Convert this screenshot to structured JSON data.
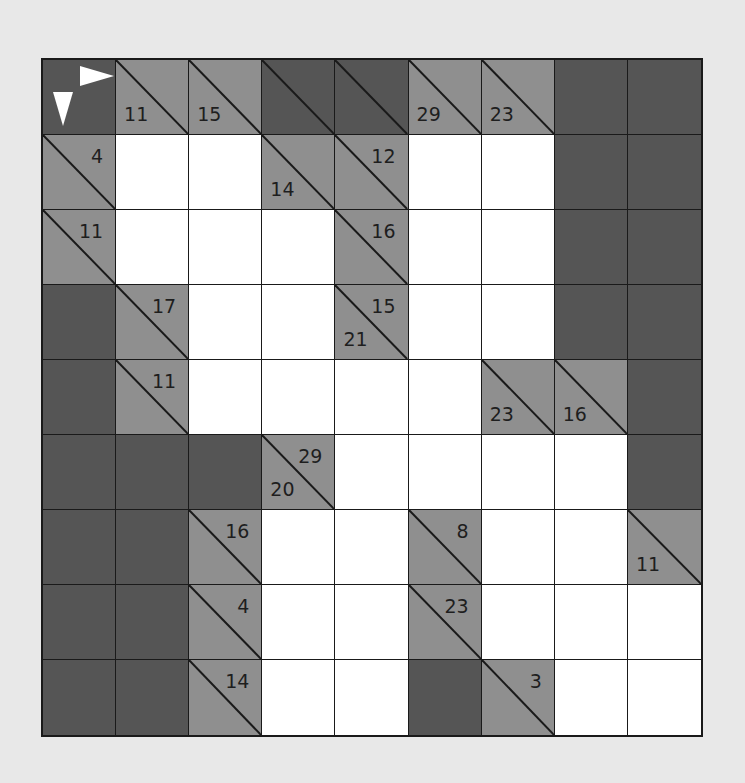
{
  "puzzle": {
    "type": "kakuro",
    "rows": 9,
    "cols": 9,
    "colors": {
      "background": "#e8e8e8",
      "dark_block": "#555555",
      "clue_cell": "#8f8f8f",
      "white_cell": "#ffffff",
      "grid_line": "#1a1a1a",
      "arrow": "#ffffff"
    },
    "start_cell": {
      "row": 0,
      "col": 0,
      "icons": [
        "arrow-right-icon",
        "arrow-down-icon"
      ]
    },
    "grid": [
      [
        {
          "t": "start"
        },
        {
          "t": "clue",
          "down": "11"
        },
        {
          "t": "clue",
          "down": "15"
        },
        {
          "t": "darkdiag"
        },
        {
          "t": "darkdiag"
        },
        {
          "t": "clue",
          "down": "29"
        },
        {
          "t": "clue",
          "down": "23"
        },
        {
          "t": "dark"
        },
        {
          "t": "dark"
        }
      ],
      [
        {
          "t": "clue",
          "across": "4"
        },
        {
          "t": "white",
          "value": ""
        },
        {
          "t": "white",
          "value": ""
        },
        {
          "t": "clue",
          "down": "14"
        },
        {
          "t": "clue",
          "across": "12"
        },
        {
          "t": "white",
          "value": ""
        },
        {
          "t": "white",
          "value": ""
        },
        {
          "t": "dark"
        },
        {
          "t": "dark"
        }
      ],
      [
        {
          "t": "clue",
          "across": "11"
        },
        {
          "t": "white",
          "value": ""
        },
        {
          "t": "white",
          "value": ""
        },
        {
          "t": "white",
          "value": ""
        },
        {
          "t": "clue",
          "across": "16"
        },
        {
          "t": "white",
          "value": ""
        },
        {
          "t": "white",
          "value": ""
        },
        {
          "t": "dark"
        },
        {
          "t": "dark"
        }
      ],
      [
        {
          "t": "dark"
        },
        {
          "t": "clue",
          "across": "17"
        },
        {
          "t": "white",
          "value": ""
        },
        {
          "t": "white",
          "value": ""
        },
        {
          "t": "clue",
          "across": "15",
          "down": "21"
        },
        {
          "t": "white",
          "value": ""
        },
        {
          "t": "white",
          "value": ""
        },
        {
          "t": "dark"
        },
        {
          "t": "dark"
        }
      ],
      [
        {
          "t": "dark"
        },
        {
          "t": "clue",
          "across": "11"
        },
        {
          "t": "white",
          "value": ""
        },
        {
          "t": "white",
          "value": ""
        },
        {
          "t": "white",
          "value": ""
        },
        {
          "t": "white",
          "value": ""
        },
        {
          "t": "clue",
          "down": "23"
        },
        {
          "t": "clue",
          "down": "16"
        },
        {
          "t": "dark"
        }
      ],
      [
        {
          "t": "dark"
        },
        {
          "t": "dark"
        },
        {
          "t": "dark"
        },
        {
          "t": "clue",
          "across": "29",
          "down": "20"
        },
        {
          "t": "white",
          "value": ""
        },
        {
          "t": "white",
          "value": ""
        },
        {
          "t": "white",
          "value": ""
        },
        {
          "t": "white",
          "value": ""
        },
        {
          "t": "dark"
        }
      ],
      [
        {
          "t": "dark"
        },
        {
          "t": "dark"
        },
        {
          "t": "clue",
          "across": "16"
        },
        {
          "t": "white",
          "value": ""
        },
        {
          "t": "white",
          "value": ""
        },
        {
          "t": "clue",
          "across": "8"
        },
        {
          "t": "white",
          "value": ""
        },
        {
          "t": "white",
          "value": ""
        },
        {
          "t": "clue",
          "down": "11"
        }
      ],
      [
        {
          "t": "dark"
        },
        {
          "t": "dark"
        },
        {
          "t": "clue",
          "across": "4"
        },
        {
          "t": "white",
          "value": ""
        },
        {
          "t": "white",
          "value": ""
        },
        {
          "t": "clue",
          "across": "23"
        },
        {
          "t": "white",
          "value": ""
        },
        {
          "t": "white",
          "value": ""
        },
        {
          "t": "white",
          "value": ""
        }
      ],
      [
        {
          "t": "dark"
        },
        {
          "t": "dark"
        },
        {
          "t": "clue",
          "across": "14"
        },
        {
          "t": "white",
          "value": ""
        },
        {
          "t": "white",
          "value": ""
        },
        {
          "t": "dark"
        },
        {
          "t": "clue",
          "across": "3"
        },
        {
          "t": "white",
          "value": ""
        },
        {
          "t": "white",
          "value": ""
        }
      ]
    ]
  }
}
